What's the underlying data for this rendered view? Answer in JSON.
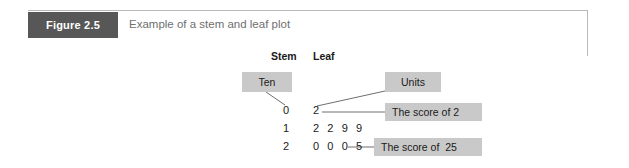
{
  "figure": {
    "label": "Figure 2.5",
    "caption": "Example of a stem and leaf plot"
  },
  "colors": {
    "label_box": "#575757",
    "label_text": "#ffffff",
    "caption_text": "#6f6f6f",
    "callout_box": "#c9c9c9",
    "callout_text": "#1a1a1a",
    "frame_border": "#b9b9b9",
    "connector_line": "#6f6f6f",
    "plot_text": "#1a1a1a"
  },
  "plot": {
    "type": "stem-and-leaf",
    "headers": {
      "stem": "Stem",
      "leaf": "Leaf"
    },
    "rows": [
      {
        "stem": "0",
        "leaf": "2"
      },
      {
        "stem": "1",
        "leaf": "2 2 9 9"
      },
      {
        "stem": "2",
        "leaf": "0 0 0 5"
      }
    ],
    "callouts": [
      {
        "name": "ten",
        "text": "Ten"
      },
      {
        "name": "units",
        "text": "Units"
      },
      {
        "name": "score-2",
        "text": "The score of 2"
      },
      {
        "name": "score-25",
        "text": "The score of  25"
      }
    ]
  }
}
